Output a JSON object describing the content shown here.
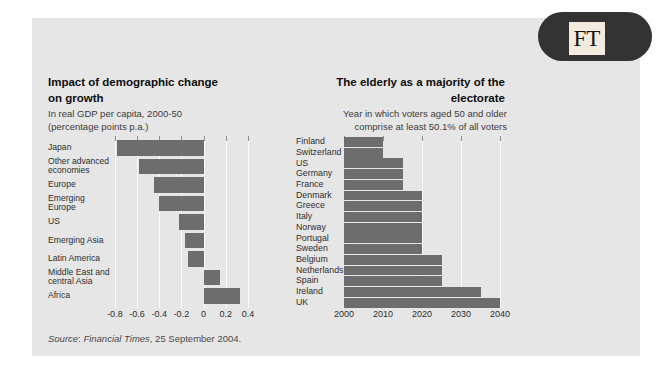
{
  "brand": {
    "logo_text": "FT"
  },
  "colors": {
    "banner": "#c8c8c8",
    "panel": "#e6e6e6",
    "bar": "#6d6d6d",
    "gridline": "#fafafa",
    "logo_background": "#333333",
    "logo_square": "#f3ebdf"
  },
  "source_line": {
    "word_source": "Source",
    "separator": ": ",
    "publication": "Financial Times",
    "rest": ", 25 September 2004."
  },
  "chart_data": [
    {
      "type": "bar",
      "orientation": "horizontal",
      "title": "Impact of demographic change on growth",
      "title_lines": [
        "Impact of demographic change",
        "on growth"
      ],
      "subtitle_lines": [
        "In real GDP per capita, 2000-50",
        "(percentage points p.a.)"
      ],
      "categories": [
        "Japan",
        "Other advanced economies",
        "Europe",
        "Emerging Europe",
        "US",
        "Emerging Asia",
        "Latin America",
        "Middle East and central Asia",
        "Africa"
      ],
      "category_label_lines": [
        [
          "Japan"
        ],
        [
          "Other advanced",
          "economies"
        ],
        [
          "Europe"
        ],
        [
          "Emerging Europe"
        ],
        [
          "US"
        ],
        [
          "Emerging Asia"
        ],
        [
          "Latin America"
        ],
        [
          "Middle East and",
          "central Asia"
        ],
        [
          "Africa"
        ]
      ],
      "values": [
        -0.78,
        -0.58,
        -0.45,
        -0.4,
        -0.22,
        -0.17,
        -0.14,
        0.15,
        0.33
      ],
      "xlabel": "",
      "ylabel": "",
      "xticks": [
        -0.8,
        -0.6,
        -0.4,
        -0.2,
        0,
        0.2,
        0.4
      ],
      "xtick_labels": [
        "-0.8",
        "-0.6",
        "-0.4",
        "-0.2",
        "0",
        "0.2",
        "0.4"
      ],
      "xlim": [
        -0.845,
        0.437
      ],
      "grid": "vertical-lines-all-ticks",
      "bar_color": "#6d6d6d"
    },
    {
      "type": "bar",
      "orientation": "horizontal",
      "title": "The elderly as a majority of the electorate",
      "title_lines": [
        "The elderly as a majority of the",
        "electorate"
      ],
      "subtitle_lines": [
        "Year in which voters aged 50 and older",
        "comprise at least 50.1% of all voters"
      ],
      "categories": [
        "Finland",
        "Switzerland",
        "US",
        "Germany",
        "France",
        "Denmark",
        "Greece",
        "Italy",
        "Norway",
        "Portugal",
        "Sweden",
        "Belgium",
        "Netherlands",
        "Spain",
        "Ireland",
        "UK"
      ],
      "values": [
        2010,
        2010,
        2015,
        2015,
        2015,
        2020,
        2020,
        2020,
        2020,
        2020,
        2020,
        2025,
        2025,
        2025,
        2035,
        2040
      ],
      "value_base": 2000,
      "xlabel": "",
      "ylabel": "",
      "xticks": [
        2000,
        2010,
        2020,
        2030,
        2040
      ],
      "xtick_labels": [
        "2000",
        "2010",
        "2020",
        "2030",
        "2040"
      ],
      "xlim": [
        2000,
        2041
      ],
      "grid": "vertical-lines",
      "full_gridline_ticks": [
        2000,
        2020,
        2030,
        2040
      ],
      "tick_only_ticks": [
        2010
      ],
      "bar_color": "#6d6d6d"
    }
  ]
}
